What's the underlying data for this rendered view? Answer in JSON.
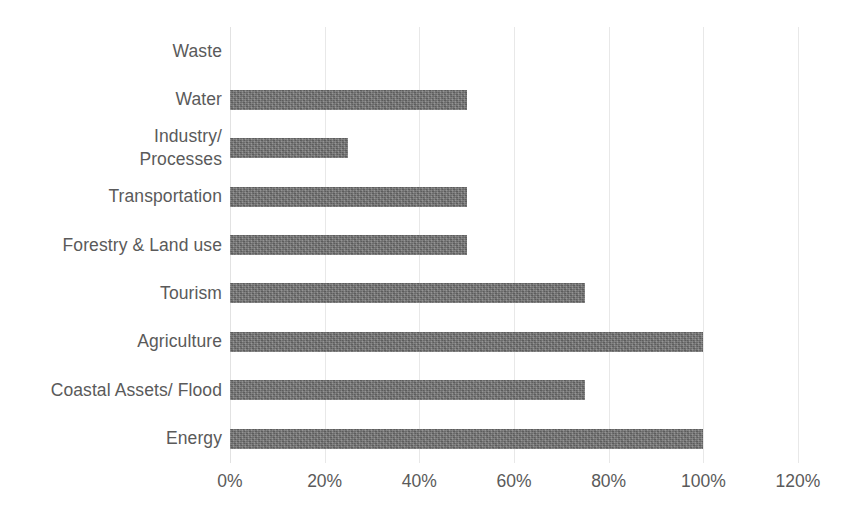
{
  "chart_data": {
    "type": "bar",
    "orientation": "horizontal",
    "title": "",
    "subtitle": "",
    "xlabel": "",
    "ylabel": "",
    "categories": [
      "Waste",
      "Water",
      "Industry/\nProcesses",
      "Transportation",
      "Forestry & Land use",
      "Tourism",
      "Agriculture",
      "Coastal Assets/ Flood",
      "Energy"
    ],
    "values": [
      0,
      50,
      25,
      50,
      50,
      75,
      100,
      75,
      100
    ],
    "value_labels": [
      "0%",
      "50%",
      "25%",
      "50%",
      "50%",
      "75%",
      "100%",
      "75%",
      "100%"
    ],
    "xlim": [
      0,
      120
    ],
    "xticks": [
      0,
      20,
      40,
      60,
      80,
      100,
      120
    ],
    "xtick_labels": [
      "0%",
      "20%",
      "40%",
      "60%",
      "80%",
      "100%",
      "120%"
    ],
    "grid": true,
    "grid_axis": "x",
    "legend": false,
    "legend_position": "none",
    "bar_color": "#6f6f6f",
    "gridline_color": "#e8e8e8",
    "text_color": "#5a5a5a",
    "background_color": "#ffffff"
  }
}
